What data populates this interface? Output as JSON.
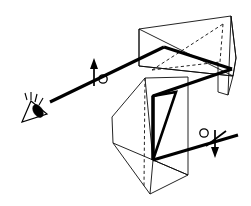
{
  "figure": {
    "title": "Polarized light path through two prisms viewed by an eye",
    "background_color": "#ffffff",
    "line_color": "#000000",
    "width": 251,
    "height": 206
  },
  "observer": {
    "label": "eye",
    "icon": "eye-icon",
    "position": {
      "x": 30,
      "y": 108
    }
  },
  "rays": {
    "label": "light ray path",
    "color": "#000000",
    "incoming_segment": "from eye up-right to first prism",
    "reflected_segment": "from right vertex down-left to lower prism",
    "outgoing_segment": "from lower prism down-right to exit"
  },
  "prisms": [
    {
      "name": "upper-prism",
      "label": "upper prism",
      "hidden_edges": "dashed"
    },
    {
      "name": "lower-prism",
      "label": "lower prism",
      "hidden_edges": "dashed"
    }
  ],
  "polarization_markers": [
    {
      "name": "polarization-marker-input",
      "label": "vertical polarization with circle",
      "arrow_direction": "up",
      "circle_side": "right",
      "position": {
        "x": 95,
        "y": 72
      }
    },
    {
      "name": "polarization-marker-output",
      "label": "vertical polarization with circle",
      "arrow_direction": "down",
      "circle_side": "left",
      "position": {
        "x": 213,
        "y": 142
      }
    }
  ]
}
